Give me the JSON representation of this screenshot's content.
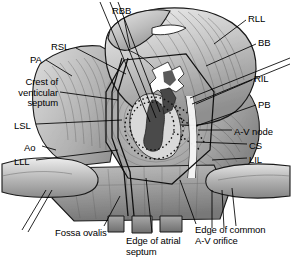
{
  "figure": {
    "background_color": "#ffffff",
    "ink_color": "#000000",
    "width": 292,
    "height": 259
  },
  "labels": {
    "rbb": {
      "text": "RBB",
      "x": 112,
      "y": 6,
      "align": "left"
    },
    "rll": {
      "text": "RLL",
      "x": 248,
      "y": 14,
      "align": "left"
    },
    "bb": {
      "text": "BB",
      "x": 258,
      "y": 38,
      "align": "left"
    },
    "rsl": {
      "text": "RSL",
      "x": 51,
      "y": 42,
      "align": "left"
    },
    "pa": {
      "text": "PA",
      "x": 30,
      "y": 55,
      "align": "left"
    },
    "ril": {
      "text": "RIL",
      "x": 254,
      "y": 74,
      "align": "left"
    },
    "crest": {
      "text": "Crest of\nventicular\nseptum",
      "x": 3,
      "y": 77,
      "align": "right"
    },
    "pb": {
      "text": "PB",
      "x": 258,
      "y": 100,
      "align": "left"
    },
    "lsl": {
      "text": "LSL",
      "x": 14,
      "y": 121,
      "align": "left"
    },
    "avnode": {
      "text": "A-V node",
      "x": 234,
      "y": 127,
      "align": "left"
    },
    "ao": {
      "text": "Ao",
      "x": 24,
      "y": 143,
      "align": "left"
    },
    "cs": {
      "text": "CS",
      "x": 249,
      "y": 141,
      "align": "left"
    },
    "lll": {
      "text": "LLL",
      "x": 14,
      "y": 157,
      "align": "left"
    },
    "lil": {
      "text": "LIL",
      "x": 249,
      "y": 155,
      "align": "left"
    },
    "fossa": {
      "text": "Fossa ovalis",
      "x": 55,
      "y": 228,
      "align": "left"
    },
    "edge_atrial": {
      "text": "Edge of atrial\nseptum",
      "x": 126,
      "y": 236,
      "align": "left"
    },
    "edge_common": {
      "text": "Edge of common\nA-V orifice",
      "x": 195,
      "y": 225,
      "align": "left"
    }
  },
  "legend_keys": [
    {
      "abbr": "RBB",
      "meaning": "right bundle branch"
    },
    {
      "abbr": "RLL",
      "meaning": "right lateral leaflet"
    },
    {
      "abbr": "BB",
      "meaning": "bundle branch"
    },
    {
      "abbr": "RSL",
      "meaning": "right superior leaflet"
    },
    {
      "abbr": "PA",
      "meaning": "pulmonary artery"
    },
    {
      "abbr": "RIL",
      "meaning": "right inferior leaflet"
    },
    {
      "abbr": "PB",
      "meaning": "posterior branch"
    },
    {
      "abbr": "LSL",
      "meaning": "left superior leaflet"
    },
    {
      "abbr": "Ao",
      "meaning": "aorta"
    },
    {
      "abbr": "LLL",
      "meaning": "left lateral leaflet"
    },
    {
      "abbr": "LIL",
      "meaning": "left inferior leaflet"
    },
    {
      "abbr": "CS",
      "meaning": "coronary sinus"
    }
  ]
}
